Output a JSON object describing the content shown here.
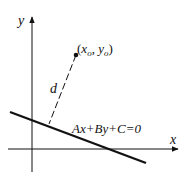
{
  "diagram": {
    "axes": {
      "x_label": "x",
      "y_label": "y"
    },
    "point": {
      "label": "(x₀, y₀)",
      "label_x": "x",
      "label_x_sub": "o",
      "label_y": "y",
      "label_y_sub": "o"
    },
    "distance_label": "d",
    "line_equation": "Ax+By+C=0",
    "colors": {
      "stroke": "#111111",
      "background": "#ffffff"
    }
  }
}
